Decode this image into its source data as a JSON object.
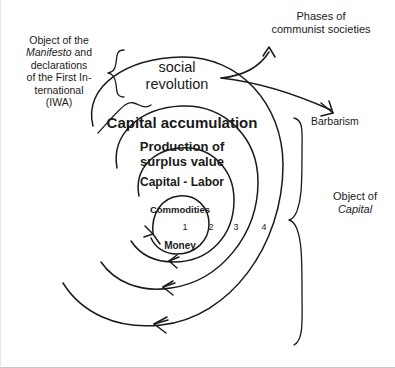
{
  "diagram": {
    "background_color": "#ffffff",
    "stroke_color": "#1a1a1a"
  },
  "annotations": {
    "object_of_manifesto": "Object of the\nManifesto and\ndeclarations\nof the First In-\nternational\n(IWA)",
    "object_of_manifesto_line1": "Object of the",
    "object_of_manifesto_italic": "Manifesto",
    "object_of_manifesto_line2": " and",
    "object_of_manifesto_line3": "declarations",
    "object_of_manifesto_line4": "of the First In-",
    "object_of_manifesto_line5": "ternational",
    "object_of_manifesto_line6": "(IWA)",
    "social_revolution": "social\nrevolution",
    "phases_of_communist_societies": "Phases of\ncommunist societies",
    "barbarism": "Barbarism",
    "object_of_capital_line1": "Object of",
    "object_of_capital_italic": "Capital"
  },
  "spiral": {
    "direction": "counterclockwise",
    "turns": 4,
    "ring_labels": [
      "Capital accumulation",
      "Production of\nsurplus value",
      "Capital - Labor",
      "Commodities",
      "Money"
    ],
    "ring_4_label": "Capital accumulation",
    "ring_3_label": "Production of\nsurplus value",
    "ring_2_label": "Capital - Labor",
    "ring_1_label_top": "Commodities",
    "ring_1_label_bottom": "Money",
    "turn_numbers": [
      "1",
      "2",
      "3",
      "4"
    ]
  }
}
